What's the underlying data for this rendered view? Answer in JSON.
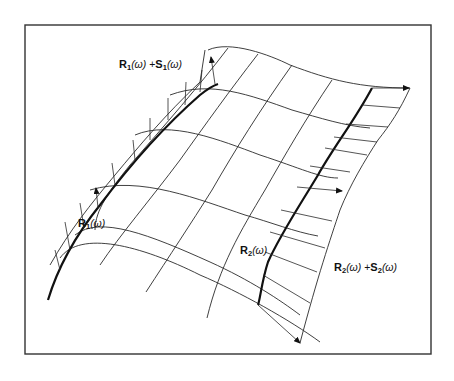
{
  "figure": {
    "type": "parametric-surface-diagram",
    "colors": {
      "line": "#2a2a2a",
      "frame": "#333333",
      "background": "#ffffff"
    },
    "labels": {
      "r1_plus_s1": {
        "R": "R",
        "R_sub": "1",
        "arg": "(ω)",
        "plus": " +",
        "S": "S",
        "S_sub": "1",
        "arg2": "(ω)"
      },
      "r1": {
        "R": "R",
        "R_sub": "1",
        "arg": "(ω)"
      },
      "r2": {
        "R": "R",
        "R_sub": "2",
        "arg": "(ω)"
      },
      "r2_plus_s2": {
        "R": "R",
        "R_sub": "2",
        "arg": "(ω)",
        "plus": " +",
        "S": "S",
        "S_sub": "2",
        "arg2": "(ω)"
      }
    },
    "curves": [
      {
        "name": "R1(w)",
        "role": "left boundary curve (bold)"
      },
      {
        "name": "R1(w)+S1(w)",
        "role": "offset curve with tangent vectors"
      },
      {
        "name": "R2(w)",
        "role": "right boundary curve (bold)"
      },
      {
        "name": "R2(w)+S2(w)",
        "role": "offset curve with tangent vectors"
      }
    ]
  }
}
